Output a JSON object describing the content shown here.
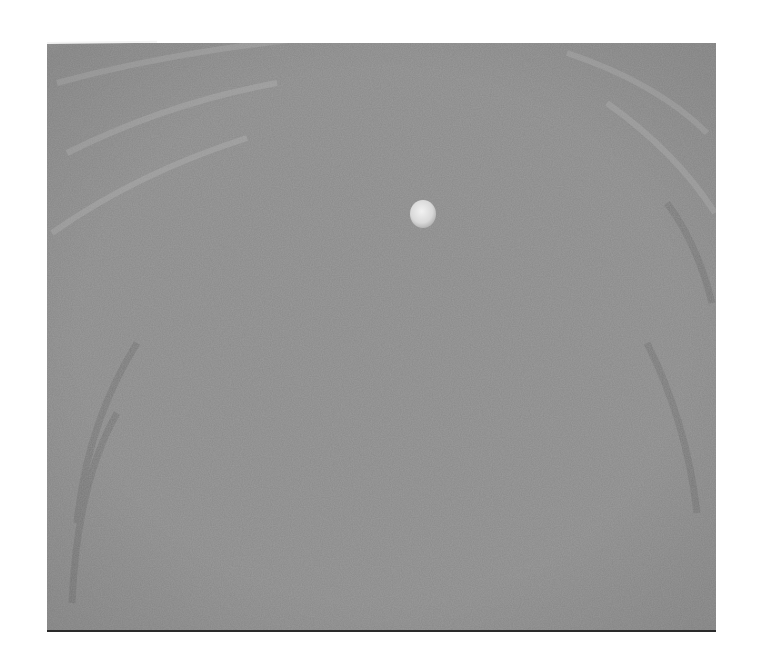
{
  "image": {
    "kind": "grayscale micrograph",
    "colors": {
      "background": "#ffffff",
      "base_gray": "#8a8a8a",
      "ripple_light": "#a6a6a6",
      "ripple_dark": "#6f6f6f",
      "particle": "#e6e6e6",
      "bottom_border": "#2a2a2a"
    },
    "particle": {
      "cx": 376,
      "cy": 171,
      "rx": 13,
      "ry": 14
    }
  }
}
